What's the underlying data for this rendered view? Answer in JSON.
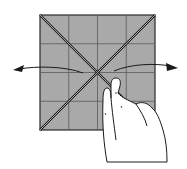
{
  "diagram": {
    "type": "origami-instruction",
    "paper": {
      "fill": "#a9a9a9",
      "edge": "#2a2a2a",
      "x": 40,
      "y": 15,
      "size": 115,
      "grid_divisions": 4,
      "crease_color": "#555555"
    },
    "arrows": [
      {
        "name": "left-arrow",
        "direction": "left"
      },
      {
        "name": "right-arrow",
        "direction": "right"
      }
    ],
    "hand": {
      "position": "lower-right",
      "action": "press-center"
    }
  }
}
